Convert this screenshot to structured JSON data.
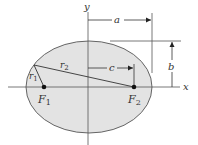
{
  "diagram": {
    "type": "ellipse-geometry",
    "colors": {
      "ellipse_fill": "#e3e3e3",
      "stroke": "#555555",
      "text": "#333333",
      "focus": "#111111"
    },
    "labels": {
      "x_axis": "x",
      "y_axis": "y",
      "semi_major": "a",
      "semi_minor": "b",
      "focal_distance": "c",
      "r1": "r",
      "r1_sub": "1",
      "r2": "r",
      "r2_sub": "2",
      "f1": "F",
      "f1_sub": "1",
      "f2": "F",
      "f2_sub": "2"
    }
  }
}
